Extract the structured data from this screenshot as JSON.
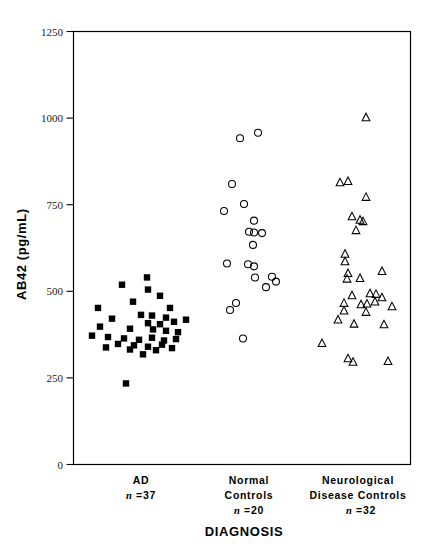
{
  "chart_data": {
    "type": "scatter",
    "title": "",
    "xlabel": "DIAGNOSIS",
    "ylabel": "AB42  (pg/mL)",
    "ylim": [
      0,
      1250
    ],
    "yticks": [
      0,
      250,
      500,
      750,
      1000,
      1250
    ],
    "ytick_labels": [
      "0",
      "250",
      "500",
      "750",
      "1000",
      "1250"
    ],
    "grid": false,
    "legend": "none",
    "categories": [
      "AD",
      "Normal Controls",
      "Neurological Disease Controls"
    ],
    "series": [
      {
        "name": "AD",
        "marker": "filled-square",
        "n": 37,
        "x_center": 141,
        "points": [
          {
            "x": 122,
            "y": 519
          },
          {
            "x": 147,
            "y": 540
          },
          {
            "x": 148,
            "y": 505
          },
          {
            "x": 98,
            "y": 452
          },
          {
            "x": 133,
            "y": 470
          },
          {
            "x": 160,
            "y": 487
          },
          {
            "x": 170,
            "y": 452
          },
          {
            "x": 112,
            "y": 421
          },
          {
            "x": 141,
            "y": 432
          },
          {
            "x": 152,
            "y": 430
          },
          {
            "x": 166,
            "y": 424
          },
          {
            "x": 148,
            "y": 408
          },
          {
            "x": 160,
            "y": 405
          },
          {
            "x": 174,
            "y": 412
          },
          {
            "x": 186,
            "y": 418
          },
          {
            "x": 100,
            "y": 398
          },
          {
            "x": 130,
            "y": 392
          },
          {
            "x": 153,
            "y": 390
          },
          {
            "x": 166,
            "y": 386
          },
          {
            "x": 178,
            "y": 382
          },
          {
            "x": 92,
            "y": 372
          },
          {
            "x": 108,
            "y": 368
          },
          {
            "x": 124,
            "y": 364
          },
          {
            "x": 139,
            "y": 360
          },
          {
            "x": 152,
            "y": 366
          },
          {
            "x": 164,
            "y": 358
          },
          {
            "x": 176,
            "y": 362
          },
          {
            "x": 118,
            "y": 348
          },
          {
            "x": 134,
            "y": 344
          },
          {
            "x": 148,
            "y": 340
          },
          {
            "x": 162,
            "y": 346
          },
          {
            "x": 106,
            "y": 338
          },
          {
            "x": 130,
            "y": 332
          },
          {
            "x": 156,
            "y": 330
          },
          {
            "x": 172,
            "y": 336
          },
          {
            "x": 143,
            "y": 318
          },
          {
            "x": 126,
            "y": 234
          }
        ]
      },
      {
        "name": "Normal Controls",
        "marker": "open-circle",
        "n": 20,
        "x_center": 248,
        "points": [
          {
            "x": 240,
            "y": 942
          },
          {
            "x": 258,
            "y": 958
          },
          {
            "x": 232,
            "y": 810
          },
          {
            "x": 244,
            "y": 752
          },
          {
            "x": 224,
            "y": 732
          },
          {
            "x": 254,
            "y": 704
          },
          {
            "x": 249,
            "y": 672
          },
          {
            "x": 254,
            "y": 670
          },
          {
            "x": 262,
            "y": 668
          },
          {
            "x": 253,
            "y": 634
          },
          {
            "x": 227,
            "y": 580
          },
          {
            "x": 248,
            "y": 578
          },
          {
            "x": 254,
            "y": 572
          },
          {
            "x": 255,
            "y": 540
          },
          {
            "x": 272,
            "y": 542
          },
          {
            "x": 276,
            "y": 528
          },
          {
            "x": 266,
            "y": 512
          },
          {
            "x": 236,
            "y": 466
          },
          {
            "x": 230,
            "y": 446
          },
          {
            "x": 243,
            "y": 364
          }
        ]
      },
      {
        "name": "Neurological Disease Controls",
        "marker": "open-triangle",
        "n": 32,
        "x_center": 360,
        "points": [
          {
            "x": 366,
            "y": 1002
          },
          {
            "x": 340,
            "y": 814
          },
          {
            "x": 348,
            "y": 818
          },
          {
            "x": 366,
            "y": 772
          },
          {
            "x": 352,
            "y": 716
          },
          {
            "x": 360,
            "y": 706
          },
          {
            "x": 363,
            "y": 702
          },
          {
            "x": 356,
            "y": 676
          },
          {
            "x": 345,
            "y": 608
          },
          {
            "x": 345,
            "y": 586
          },
          {
            "x": 348,
            "y": 552
          },
          {
            "x": 382,
            "y": 558
          },
          {
            "x": 347,
            "y": 536
          },
          {
            "x": 360,
            "y": 538
          },
          {
            "x": 352,
            "y": 488
          },
          {
            "x": 370,
            "y": 494
          },
          {
            "x": 376,
            "y": 492
          },
          {
            "x": 382,
            "y": 482
          },
          {
            "x": 344,
            "y": 466
          },
          {
            "x": 361,
            "y": 462
          },
          {
            "x": 367,
            "y": 464
          },
          {
            "x": 375,
            "y": 470
          },
          {
            "x": 392,
            "y": 456
          },
          {
            "x": 344,
            "y": 444
          },
          {
            "x": 366,
            "y": 440
          },
          {
            "x": 338,
            "y": 418
          },
          {
            "x": 354,
            "y": 406
          },
          {
            "x": 384,
            "y": 404
          },
          {
            "x": 322,
            "y": 350
          },
          {
            "x": 348,
            "y": 306
          },
          {
            "x": 353,
            "y": 296
          },
          {
            "x": 388,
            "y": 298
          }
        ]
      }
    ]
  },
  "axes": {
    "y_title": "AB42  (pg/mL)",
    "x_title": "DIAGNOSIS"
  },
  "groups": [
    {
      "id": "ad",
      "lines": [
        "AD"
      ],
      "n_prefix": "n",
      "n_value": "=37"
    },
    {
      "id": "normal-controls",
      "lines": [
        "Normal",
        "Controls"
      ],
      "n_prefix": "n",
      "n_value": "=20"
    },
    {
      "id": "neurological-disease-controls",
      "lines": [
        "Neurological",
        "Disease  Controls"
      ],
      "n_prefix": "n",
      "n_value": "=32"
    }
  ],
  "colors": {
    "ink": "#000000",
    "background": "#ffffff",
    "tick_text": "#1a1a1a"
  }
}
